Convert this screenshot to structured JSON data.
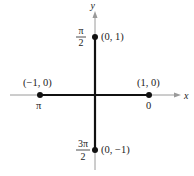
{
  "figure": {
    "axes": {
      "x_label": "x",
      "y_label": "y"
    },
    "points": [
      {
        "id": "right",
        "coord_label": "(1, 0)",
        "angle_label": "0"
      },
      {
        "id": "top",
        "coord_label": "(0, 1)",
        "angle_num": "π",
        "angle_den": "2"
      },
      {
        "id": "left",
        "coord_label": "(−1, 0)",
        "angle_label": "π"
      },
      {
        "id": "bottom",
        "coord_label": "(0, −1)",
        "angle_num": "3π",
        "angle_den": "2"
      }
    ],
    "colors": {
      "axis": "#999999",
      "segment": "#111111",
      "dot": "#111111",
      "text": "#222222"
    }
  }
}
